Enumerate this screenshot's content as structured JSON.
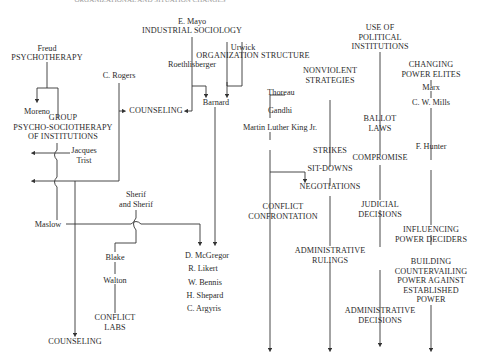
{
  "title": "ORGANIZATIONAL AND SITUATION CHANGES",
  "nodes": {
    "freud": "Freud",
    "psychotherapy": "PSYCHOTHERAPY",
    "moreno": "Moreno",
    "group_psycho": "GROUP\nPSYCHO-SOCIOTHERAPY\nOF INSTITUTIONS",
    "jacques_trist": "Jacques\nTrist",
    "c_rogers": "C. Rogers",
    "counseling_top": "COUNSELING",
    "e_mayo": "E. Mayo",
    "industrial_sociology": "INDUSTRIAL SOCIOLOGY",
    "roethlisberger": "Roethlisberger",
    "urwick": "Urwick",
    "organization_structure": "ORGANIZATION STRUCTURE",
    "barnard": "Barnard",
    "maslow": "Maslow",
    "sherif": "Sherif\nand Sherif",
    "blake": "Blake",
    "walton": "Walton",
    "conflict_labs": "CONFLICT\nLABS",
    "counseling_bottom": "COUNSELING",
    "people_list": [
      "D. McGregor",
      "R. Likert",
      "W. Bennis",
      "H. Shepard",
      "C. Argyris"
    ],
    "thoreau": "Thoreau",
    "gandhi": "Gandhi",
    "mlk": "Martin Luther King Jr.",
    "nonviolent": "NONVIOLENT\nSTRATEGIES",
    "strikes": "STRIKES",
    "sit_downs": "SIT-DOWNS",
    "negotiations": "NEGOTIATIONS",
    "conflict_confrontation": "CONFLICT\nCONFRONTATION",
    "administrative_rulings": "ADMINISTRATIVE\nRULINGS",
    "political_institutions": "USE OF\nPOLITICAL\nINSTITUTIONS",
    "ballot_laws": "BALLOT\nLAWS",
    "compromise": "COMPROMISE",
    "judicial_decisions": "JUDICIAL\nDECISIONS",
    "administrative_decisions": "ADMINISTRATIVE\nDECISIONS",
    "changing_power_elites": "CHANGING\nPOWER ELITES",
    "marx": "Marx",
    "cw_mills": "C. W. Mills",
    "f_hunter": "F. Hunter",
    "influencing_power": "INFLUENCING\nPOWER DECIDERS",
    "building_power": "BUILDING\nCOUNTERVAILING\nPOWER AGAINST\nESTABLISHED\nPOWER"
  }
}
